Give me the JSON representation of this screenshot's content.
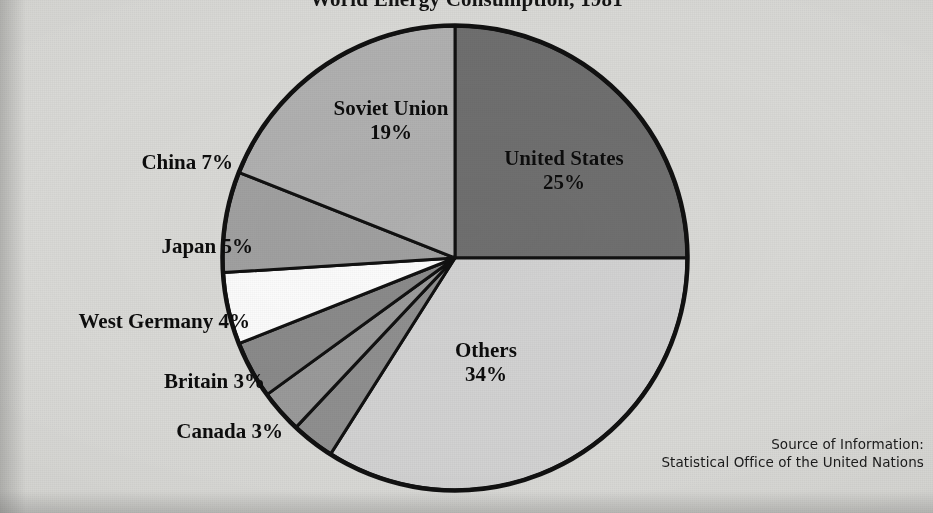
{
  "chart_data": {
    "type": "pie",
    "title": "World Energy Consumption, 1981",
    "categories": [
      "United States",
      "Others",
      "Canada",
      "Britain",
      "West Germany",
      "Japan",
      "China",
      "Soviet Union"
    ],
    "values": [
      25,
      34,
      3,
      3,
      4,
      5,
      7,
      19
    ],
    "unit": "%",
    "start_angle_deg": 0,
    "direction": "clockwise",
    "legend": "none",
    "slice_colors": [
      "#6f6f6f",
      "#d2d2d2",
      "#8f8f8f",
      "#9a9a9a",
      "#8a8a8a",
      "#fbfbfb",
      "#a0a0a0",
      "#b0b0b0"
    ],
    "slices": [
      {
        "name": "United States",
        "value": 25,
        "label_line1": "United States",
        "label_line2": "25%",
        "label_position": "inside",
        "color": "#6f6f6f"
      },
      {
        "name": "Others",
        "value": 34,
        "label_line1": "Others",
        "label_line2": "34%",
        "label_position": "inside",
        "color": "#d2d2d2"
      },
      {
        "name": "Canada",
        "value": 3,
        "label_line1": "Canada  3%",
        "label_position": "outside-left",
        "color": "#8f8f8f"
      },
      {
        "name": "Britain",
        "value": 3,
        "label_line1": "Britain  3%",
        "label_position": "outside-left",
        "color": "#9a9a9a"
      },
      {
        "name": "West Germany",
        "value": 4,
        "label_line1": "West Germany 4%",
        "label_position": "outside-left",
        "color": "#8a8a8a"
      },
      {
        "name": "Japan",
        "value": 5,
        "label_line1": "Japan  5%",
        "label_position": "outside-left",
        "color": "#fbfbfb"
      },
      {
        "name": "China",
        "value": 7,
        "label_line1": "China 7%",
        "label_position": "outside-left",
        "color": "#a0a0a0"
      },
      {
        "name": "Soviet Union",
        "value": 19,
        "label_line1": "Soviet Union",
        "label_line2": "19%",
        "label_position": "inside",
        "color": "#b0b0b0"
      }
    ]
  },
  "labels": {
    "soviet_union": {
      "line1": "Soviet Union",
      "line2": "19%"
    },
    "united_states": {
      "line1": "United States",
      "line2": "25%"
    },
    "others": {
      "line1": "Others",
      "line2": "34%"
    },
    "china": "China 7%",
    "japan": "Japan  5%",
    "west_germany": "West Germany 4%",
    "britain": "Britain  3%",
    "canada": "Canada  3%"
  },
  "source": {
    "line1": "Source of Information:",
    "line2": "Statistical Office of the United Nations"
  },
  "colors": {
    "page_background": "#d9d9d6",
    "outline": "#111111",
    "text": "#0d0d0d"
  }
}
